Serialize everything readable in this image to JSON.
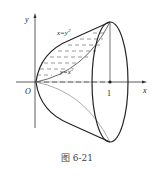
{
  "figure": {
    "caption": "图 6-21",
    "axes": {
      "x_label": "x",
      "y_label": "y",
      "origin_label": "O",
      "tick_label": "1"
    },
    "curves": [
      {
        "name": "upper",
        "label": "x=y²",
        "label_main": "x=y",
        "label_sup": "2"
      },
      {
        "name": "lower",
        "label": "y=x²",
        "label_main": "y=x",
        "label_sup": "2"
      }
    ],
    "colors": {
      "line": "#222222",
      "hatch": "#555555",
      "thin": "#888888"
    }
  }
}
